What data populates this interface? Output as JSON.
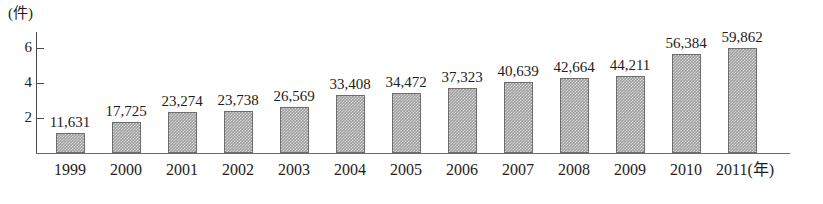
{
  "chart_data": {
    "type": "bar",
    "title": "",
    "subtitle": "",
    "xlabel": "年",
    "ylabel": "件",
    "y_unit_caption": "(件)",
    "x_unit_caption": "(年)",
    "categories": [
      "1999",
      "2000",
      "2001",
      "2002",
      "2003",
      "2004",
      "2005",
      "2006",
      "2007",
      "2008",
      "2009",
      "2010",
      "2011"
    ],
    "values": [
      11631,
      17725,
      23274,
      23738,
      26569,
      33408,
      34472,
      37323,
      40639,
      42664,
      44211,
      56384,
      59862
    ],
    "value_labels": [
      "11,631",
      "17,725",
      "23,274",
      "23,738",
      "26,569",
      "33,408",
      "34,472",
      "37,323",
      "40,639",
      "42,664",
      "44,211",
      "56,384",
      "59,862"
    ],
    "x_tick_labels": [
      "1999",
      "2000",
      "2001",
      "2002",
      "2003",
      "2004",
      "2005",
      "2006",
      "2007",
      "2008",
      "2009",
      "2010",
      "2011(年)"
    ],
    "y_ticks": [
      2,
      4,
      6
    ],
    "y_tick_labels": [
      "2",
      "4",
      "6"
    ],
    "y_tick_scale": 10000,
    "ylim": [
      0,
      7
    ],
    "grid": false,
    "legend": false,
    "legend_position": "none",
    "bar_color": "#9e9e9e",
    "bar_border_color": "#6d6d6d",
    "axis_color": "#4a4a4a",
    "text_color": "#1d1d1d",
    "background_color": "#ffffff"
  }
}
